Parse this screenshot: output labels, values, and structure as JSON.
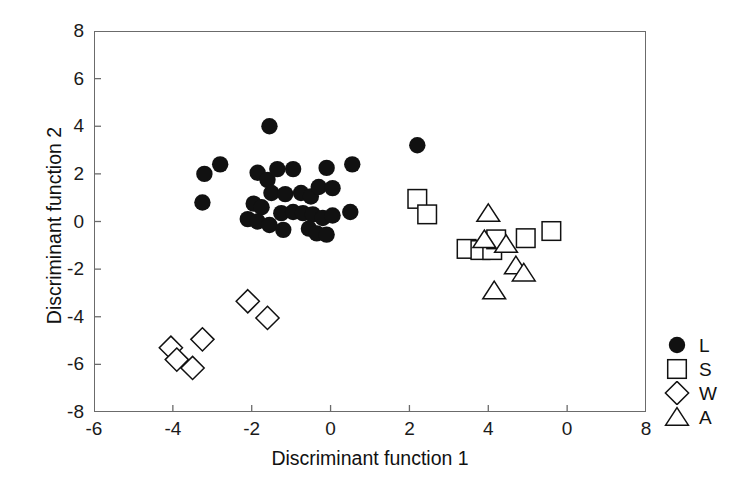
{
  "chart_data": {
    "type": "scatter",
    "title": "",
    "xlabel": "Discriminant function 1",
    "ylabel": "Discriminant function 2",
    "xlim": [
      -6,
      8
    ],
    "ylim": [
      -8,
      8
    ],
    "xticks": [
      -6,
      -4,
      -2,
      0,
      2,
      4,
      6,
      8
    ],
    "xtick_labels": [
      "-6",
      "-4",
      "-2",
      "0",
      "2",
      "4",
      "0",
      "8"
    ],
    "yticks": [
      -8,
      -6,
      -4,
      -2,
      0,
      2,
      4,
      6,
      8
    ],
    "ytick_labels": [
      "-8",
      "-6",
      "-4",
      "-2",
      "0",
      "2",
      "4",
      "6",
      "8"
    ],
    "grid": false,
    "legend_position": "right",
    "marker_color": "#111111",
    "frame_color": "#6b6b6b",
    "series": [
      {
        "name": "L",
        "marker": "filled-circle",
        "points": [
          [
            -1.55,
            4.0
          ],
          [
            -3.2,
            2.0
          ],
          [
            -2.8,
            2.4
          ],
          [
            -1.85,
            2.05
          ],
          [
            -1.6,
            1.75
          ],
          [
            -1.35,
            2.2
          ],
          [
            -0.95,
            2.2
          ],
          [
            -0.1,
            2.25
          ],
          [
            0.55,
            2.4
          ],
          [
            2.2,
            3.2
          ],
          [
            -3.25,
            0.8
          ],
          [
            -1.5,
            1.2
          ],
          [
            -1.15,
            1.15
          ],
          [
            -0.75,
            1.2
          ],
          [
            -0.5,
            1.05
          ],
          [
            -0.3,
            1.45
          ],
          [
            0.05,
            1.4
          ],
          [
            -1.95,
            0.75
          ],
          [
            -1.75,
            0.6
          ],
          [
            -1.25,
            0.35
          ],
          [
            -0.95,
            0.4
          ],
          [
            -0.7,
            0.35
          ],
          [
            -0.45,
            0.3
          ],
          [
            -0.2,
            0.15
          ],
          [
            0.05,
            0.25
          ],
          [
            -2.1,
            0.1
          ],
          [
            -1.85,
            0.0
          ],
          [
            -1.55,
            -0.15
          ],
          [
            -1.2,
            -0.35
          ],
          [
            -0.55,
            -0.3
          ],
          [
            -0.35,
            -0.5
          ],
          [
            -0.1,
            -0.55
          ],
          [
            0.5,
            0.4
          ]
        ]
      },
      {
        "name": "S",
        "marker": "open-square",
        "points": [
          [
            2.2,
            0.95
          ],
          [
            2.45,
            0.3
          ],
          [
            3.45,
            -1.15
          ],
          [
            3.8,
            -1.2
          ],
          [
            4.1,
            -1.2
          ],
          [
            4.2,
            -0.75
          ],
          [
            4.95,
            -0.7
          ],
          [
            5.6,
            -0.4
          ]
        ]
      },
      {
        "name": "W",
        "marker": "open-diamond",
        "points": [
          [
            -4.05,
            -5.3
          ],
          [
            -3.9,
            -5.8
          ],
          [
            -3.5,
            -6.15
          ],
          [
            -3.25,
            -4.95
          ],
          [
            -2.1,
            -3.35
          ],
          [
            -1.6,
            -4.05
          ]
        ]
      },
      {
        "name": "A",
        "marker": "open-triangle",
        "points": [
          [
            4.0,
            0.35
          ],
          [
            3.9,
            -0.75
          ],
          [
            4.45,
            -0.95
          ],
          [
            4.7,
            -1.85
          ],
          [
            4.9,
            -2.15
          ],
          [
            4.15,
            -2.9
          ]
        ]
      }
    ],
    "legend": [
      {
        "label": "L",
        "marker": "filled-circle"
      },
      {
        "label": "S",
        "marker": "open-square"
      },
      {
        "label": "W",
        "marker": "open-diamond"
      },
      {
        "label": "A",
        "marker": "open-triangle"
      }
    ]
  }
}
